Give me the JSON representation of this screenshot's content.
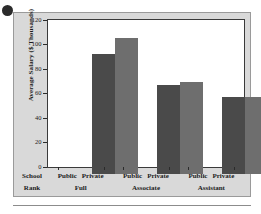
{
  "chart_data": {
    "type": "bar",
    "title": "",
    "xlabel": "School Rank",
    "ylabel": "Average Salary ($ Thousands)",
    "ylim": [
      0,
      120
    ],
    "yticks": [
      0,
      20,
      40,
      60,
      80,
      100,
      120
    ],
    "grid": false,
    "legend": "none",
    "categories": [
      "Full",
      "Associate",
      "Assistant"
    ],
    "series": [
      {
        "name": "Public",
        "values": [
          98,
          73,
          62.5
        ],
        "color": "#4a4a4a"
      },
      {
        "name": "Private",
        "values": [
          111,
          75,
          62.5
        ],
        "color": "#6e6e6e"
      }
    ],
    "group_sector_labels": [
      "Public",
      "Private"
    ]
  },
  "axes": {
    "y_title": "Average Salary ($ Thousands)",
    "x_title_line1": "School",
    "x_title_line2": "Rank",
    "y_tick_labels": [
      "120",
      "100",
      "80",
      "60",
      "40",
      "20",
      "0"
    ]
  },
  "groups": [
    {
      "sector_a": "Public",
      "sector_b": "Private",
      "rank": "Full"
    },
    {
      "sector_a": "Public",
      "sector_b": "Private",
      "rank": "Associate"
    },
    {
      "sector_a": "Public",
      "sector_b": "Private",
      "rank": "Assistant"
    }
  ],
  "decoration": {
    "bullet": "bullet-dot"
  }
}
